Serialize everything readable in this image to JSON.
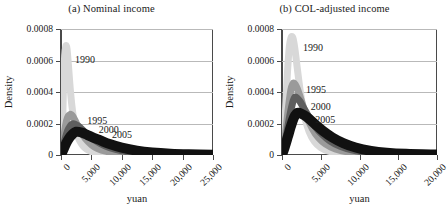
{
  "figure": {
    "background": "#ffffff",
    "axis_color": "#4a4a4a",
    "grid_color": "#b9b9b9"
  },
  "chart_data": [
    {
      "type": "line",
      "panel_id": "a",
      "title": "(a) Nominal income",
      "xlabel": "yuan",
      "ylabel": "Density",
      "xlim": [
        0,
        25000
      ],
      "ylim": [
        0,
        0.0008
      ],
      "xticks": [
        0,
        5000,
        10000,
        15000,
        20000,
        25000
      ],
      "xticklabels": [
        "0",
        "5,000",
        "10,000",
        "15,000",
        "20,000",
        "25,000"
      ],
      "yticks": [
        0,
        0.0002,
        0.0004,
        0.0006,
        0.0008
      ],
      "yticklabels": [
        "0",
        "0.0002",
        "0.0004",
        "0.0006",
        "0.0008"
      ],
      "grid": true,
      "legend": "inline-annotations",
      "series": [
        {
          "name": "1990",
          "color": "#d8d8d8",
          "peak_x": 900,
          "peak_y": 0.00069,
          "label_x": 2300,
          "label_y": 0.00064,
          "x": [
            0,
            200,
            400,
            600,
            800,
            900,
            1000,
            1200,
            1500,
            1800,
            2200,
            2600,
            3000,
            3600,
            4200,
            5000,
            6000,
            7000,
            8500,
            10000,
            12500,
            15000,
            20000,
            25000
          ],
          "y": [
            0,
            0.00012,
            0.00042,
            0.00063,
            0.00069,
            0.00069,
            0.00067,
            0.00058,
            0.00043,
            0.00031,
            0.0002,
            0.000135,
            9.5e-05,
            5.8e-05,
            3.7e-05,
            2.1e-05,
            1.1e-05,
            6e-06,
            3e-06,
            1.5e-06,
            6e-07,
            3e-07,
            1e-07,
            5e-08
          ]
        },
        {
          "name": "1995",
          "color": "#9a9a9a",
          "peak_x": 1600,
          "peak_y": 0.000258,
          "label_x": 4300,
          "label_y": 0.000252,
          "x": [
            0,
            300,
            600,
            900,
            1200,
            1500,
            1600,
            1800,
            2200,
            2600,
            3200,
            4000,
            5000,
            6000,
            7500,
            9000,
            11000,
            13000,
            16000,
            19000,
            22000,
            25000
          ],
          "y": [
            0,
            6e-05,
            0.00015,
            0.000215,
            0.000248,
            0.000257,
            0.000258,
            0.000253,
            0.000228,
            0.000196,
            0.000152,
            0.000105,
            6.55e-05,
            4.15e-05,
            2.25e-05,
            1.28e-05,
            6.2e-06,
            3.2e-06,
            1.3e-06,
            6e-07,
            3e-07,
            1.5e-07
          ]
        },
        {
          "name": "2000",
          "color": "#5e5e5e",
          "peak_x": 2000,
          "peak_y": 0.000198,
          "label_x": 6200,
          "label_y": 0.000196,
          "x": [
            0,
            300,
            700,
            1100,
            1500,
            1800,
            2000,
            2300,
            2800,
            3400,
            4200,
            5200,
            6500,
            8000,
            10000,
            12500,
            15000,
            18000,
            21000,
            25000
          ],
          "y": [
            0,
            4.2e-05,
            0.000105,
            0.000155,
            0.000183,
            0.000194,
            0.000198,
            0.000196,
            0.000185,
            0.000165,
            0.000135,
            0.000104,
            7.25e-05,
            4.65e-05,
            2.62e-05,
            1.35e-05,
            7.2e-06,
            3.5e-06,
            1.8e-06,
            8e-07
          ]
        },
        {
          "name": "2005",
          "color": "#111111",
          "peak_x": 2500,
          "peak_y": 0.000148,
          "label_x": 8400,
          "label_y": 0.000168,
          "x": [
            0,
            400,
            900,
            1400,
            1900,
            2300,
            2500,
            2900,
            3500,
            4300,
            5300,
            6500,
            8000,
            10000,
            12500,
            15000,
            18000,
            21000,
            25000
          ],
          "y": [
            0,
            3.5e-05,
            7.8e-05,
            0.000111,
            0.000133,
            0.000145,
            0.000148,
            0.000147,
            0.000141,
            0.000128,
            0.000111,
            9.25e-05,
            6.95e-05,
            4.62e-05,
            2.72e-05,
            1.58e-05,
            8.2e-06,
            4.4e-06,
            1.9e-06
          ]
        }
      ]
    },
    {
      "type": "line",
      "panel_id": "b",
      "title": "(b) COL-adjusted income",
      "xlabel": "yuan",
      "ylabel": "Density",
      "xlim": [
        0,
        20000
      ],
      "ylim": [
        0,
        0.0008
      ],
      "xticks": [
        0,
        5000,
        10000,
        15000,
        20000
      ],
      "xticklabels": [
        "0",
        "5,000",
        "10,000",
        "15,000",
        "20,000"
      ],
      "yticks": [
        0,
        0.0002,
        0.0004,
        0.0006,
        0.0008
      ],
      "yticklabels": [
        "0",
        "0.0002",
        "0.0004",
        "0.0006",
        "0.0008"
      ],
      "grid": true,
      "legend": "inline-annotations",
      "series": [
        {
          "name": "1990",
          "color": "#d8d8d8",
          "peak_x": 1300,
          "peak_y": 0.000752,
          "label_x": 2700,
          "label_y": 0.00072,
          "x": [
            0,
            200,
            450,
            700,
            950,
            1150,
            1300,
            1450,
            1700,
            2000,
            2400,
            2900,
            3500,
            4200,
            5000,
            6000,
            7200,
            8500,
            10000,
            12000,
            14000,
            17000,
            20000
          ],
          "y": [
            0,
            8e-05,
            0.00028,
            0.00052,
            0.00069,
            0.000742,
            0.000752,
            0.000736,
            0.00066,
            0.00054,
            0.00039,
            0.00025,
            0.000148,
            8.5e-05,
            4.7e-05,
            2.45e-05,
            1.25e-05,
            6.8e-06,
            3.5e-06,
            1.5e-06,
            7e-07,
            3e-07,
            1.2e-07
          ]
        },
        {
          "name": "1995",
          "color": "#9a9a9a",
          "peak_x": 1500,
          "peak_y": 0.000457,
          "label_x": 3100,
          "label_y": 0.000448,
          "x": [
            0,
            250,
            550,
            850,
            1150,
            1400,
            1500,
            1700,
            2000,
            2400,
            2900,
            3500,
            4300,
            5200,
            6300,
            7600,
            9000,
            11000,
            13000,
            16000,
            20000
          ],
          "y": [
            0,
            6e-05,
            0.000175,
            0.00031,
            0.000415,
            0.000452,
            0.000457,
            0.000449,
            0.000418,
            0.00036,
            0.000285,
            0.000207,
            0.000135,
            8.55e-05,
            5.05e-05,
            2.85e-05,
            1.65e-05,
            7.8e-06,
            3.8e-06,
            1.5e-06,
            5e-07
          ]
        },
        {
          "name": "2000",
          "color": "#5e5e5e",
          "peak_x": 1700,
          "peak_y": 0.000368,
          "label_x": 3700,
          "label_y": 0.000342,
          "x": [
            0,
            300,
            650,
            1000,
            1350,
            1600,
            1700,
            1950,
            2300,
            2800,
            3400,
            4200,
            5100,
            6200,
            7500,
            9000,
            11000,
            13000,
            16000,
            20000
          ],
          "y": [
            0,
            6e-05,
            0.000148,
            0.000248,
            0.000328,
            0.000363,
            0.000368,
            0.000362,
            0.000341,
            0.000299,
            0.000247,
            0.000187,
            0.000134,
            8.85e-05,
            5.55e-05,
            3.25e-05,
            1.58e-05,
            7.8e-06,
            3.1e-06,
            1.1e-06
          ]
        },
        {
          "name": "2005",
          "color": "#111111",
          "peak_x": 2100,
          "peak_y": 0.000268,
          "label_x": 4300,
          "label_y": 0.000262,
          "x": [
            0,
            350,
            750,
            1150,
            1550,
            1900,
            2100,
            2400,
            2900,
            3500,
            4300,
            5300,
            6500,
            7900,
            9500,
            11500,
            13500,
            16000,
            20000
          ],
          "y": [
            0,
            5e-05,
            0.000115,
            0.000182,
            0.000238,
            0.000264,
            0.000268,
            0.000265,
            0.000252,
            0.000229,
            0.000194,
            0.000152,
            0.000111,
            7.55e-05,
            4.75e-05,
            2.65e-05,
            1.48e-05,
            7.5e-06,
            2.6e-06
          ]
        }
      ]
    }
  ]
}
